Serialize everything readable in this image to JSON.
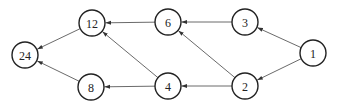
{
  "diagram": {
    "type": "directed-graph",
    "node_radius": 13,
    "colors": {
      "stroke": "#222222",
      "edge": "#444444",
      "background": "#ffffff"
    },
    "nodes": [
      {
        "id": "n24",
        "label": "24",
        "x": 25,
        "y": 55
      },
      {
        "id": "n12",
        "label": "12",
        "x": 92,
        "y": 23
      },
      {
        "id": "n6",
        "label": "6",
        "x": 168,
        "y": 22
      },
      {
        "id": "n3",
        "label": "3",
        "x": 245,
        "y": 22
      },
      {
        "id": "n1",
        "label": "1",
        "x": 313,
        "y": 53
      },
      {
        "id": "n8",
        "label": "8",
        "x": 91,
        "y": 87
      },
      {
        "id": "n4",
        "label": "4",
        "x": 168,
        "y": 86
      },
      {
        "id": "n2",
        "label": "2",
        "x": 245,
        "y": 86
      }
    ],
    "edges": [
      {
        "from": "n1",
        "to": "n3"
      },
      {
        "from": "n1",
        "to": "n2"
      },
      {
        "from": "n3",
        "to": "n6"
      },
      {
        "from": "n2",
        "to": "n6"
      },
      {
        "from": "n2",
        "to": "n4"
      },
      {
        "from": "n6",
        "to": "n12"
      },
      {
        "from": "n4",
        "to": "n12"
      },
      {
        "from": "n4",
        "to": "n8"
      },
      {
        "from": "n12",
        "to": "n24"
      },
      {
        "from": "n8",
        "to": "n24"
      }
    ]
  }
}
